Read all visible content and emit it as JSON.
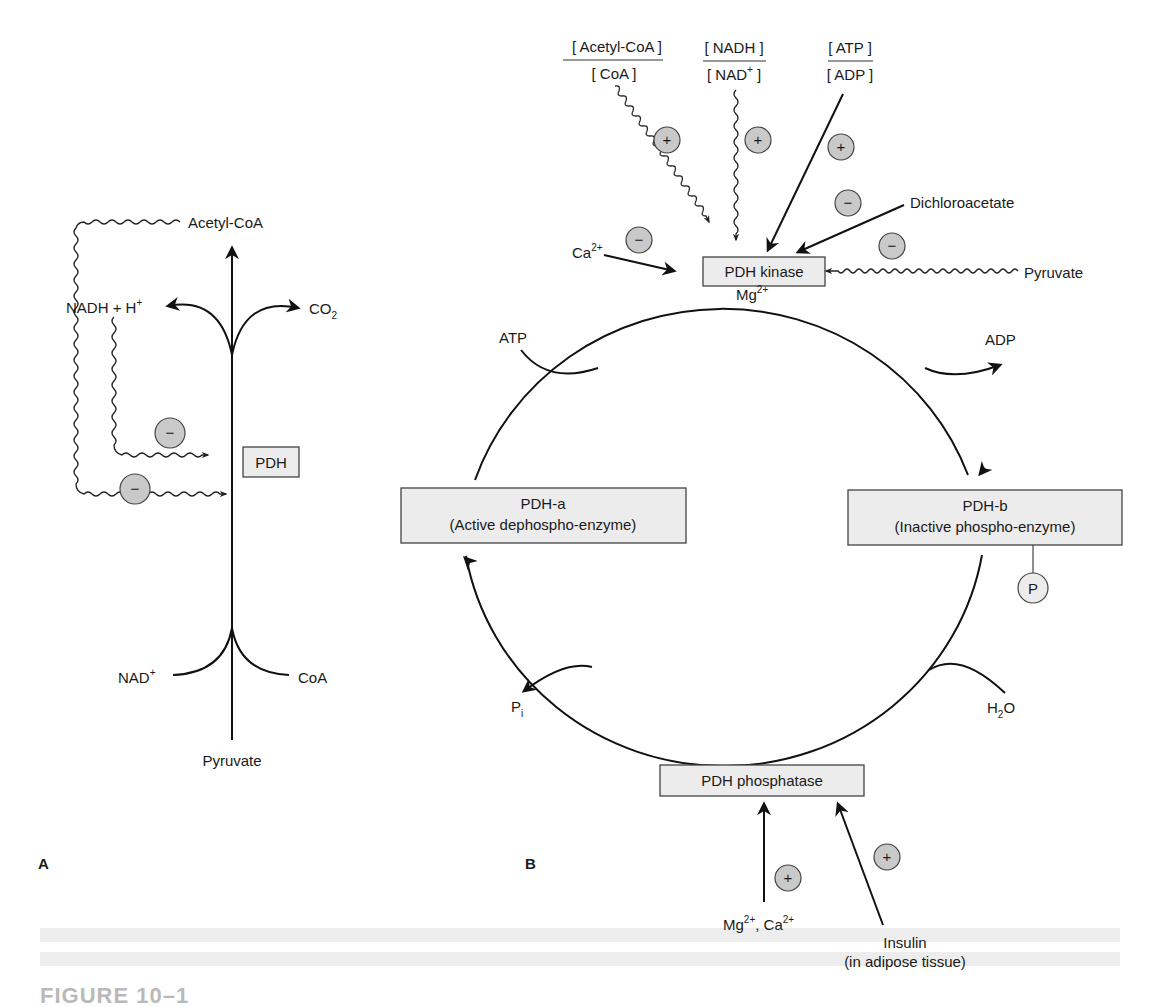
{
  "panel_a": {
    "letter": "A",
    "labels": {
      "acetyl_coa": "Acetyl-CoA",
      "nadh_h": "NADH + H",
      "nadh_h_sup": "+",
      "co2": "CO",
      "co2_sub": "2",
      "pdh": "PDH",
      "nad": "NAD",
      "nad_sup": "+",
      "coa": "CoA",
      "pyruvate": "Pyruvate"
    },
    "inhibition_badges": [
      "−",
      "−"
    ]
  },
  "panel_b": {
    "letter": "B",
    "ratios": [
      {
        "numerator": "[ Acetyl-CoA ]",
        "denominator": "[ CoA ]",
        "effect": "+"
      },
      {
        "numerator": "[ NADH ]",
        "denominator": "[ NAD",
        "denominator_sup": "+",
        "denominator_end": " ]",
        "effect": "+"
      },
      {
        "numerator": "[ ATP ]",
        "denominator": "[ ADP ]",
        "effect": "+"
      }
    ],
    "kinase_regulators": {
      "ca": "Ca",
      "ca_sup": "2+",
      "ca_effect": "−",
      "dichloroacetate": "Dichloroacetate",
      "dichloroacetate_effect": "−",
      "pyruvate": "Pyruvate",
      "pyruvate_effect": "−"
    },
    "enzymes": {
      "kinase": "PDH kinase",
      "phosphatase": "PDH phosphatase",
      "pdh_a_line1": "PDH-a",
      "pdh_a_line2": "(Active dephospho-enzyme)",
      "pdh_b_line1": "PDH-b",
      "pdh_b_line2": "(Inactive phospho-enzyme)"
    },
    "cycle_labels": {
      "mg": "Mg",
      "mg_sup": "2+",
      "atp": "ATP",
      "adp": "ADP",
      "pi": "P",
      "pi_sub": "i",
      "h2o_h": "H",
      "h2o_sub": "2",
      "h2o_o": "O",
      "phosphate": "P"
    },
    "phosphatase_regulators": {
      "ions": "Mg",
      "ions_sup1": "2+",
      "ions_mid": ", Ca",
      "ions_sup2": "2+",
      "ions_effect": "+",
      "insulin_line1": "Insulin",
      "insulin_line2": "(in adipose tissue)",
      "insulin_effect": "+"
    }
  },
  "caption": {
    "figure_label": "FIGURE 10–1"
  },
  "colors": {
    "box_fill": "#ececec",
    "badge_fill": "#c9c9c9",
    "line": "#111111"
  }
}
